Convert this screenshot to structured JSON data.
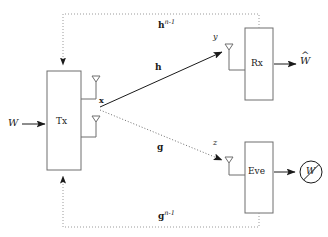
{
  "diagram": {
    "stroke_color": "#6e6e6e",
    "text_color": "#1a1a1a",
    "background": "#ffffff",
    "blocks": [
      {
        "id": "tx",
        "label": "Tx",
        "name": "transmitter-block"
      },
      {
        "id": "rx",
        "label": "Rx",
        "name": "receiver-block"
      },
      {
        "id": "eve",
        "label": "Eve",
        "name": "eavesdropper-block"
      }
    ],
    "signals": {
      "message_in": "W",
      "estimate_out": "W",
      "estimate_out_accent": "^",
      "tx_signal": "x",
      "rx_signal": "y",
      "eve_signal": "z"
    },
    "channels": [
      {
        "id": "main",
        "label": "h",
        "style": "solid",
        "name": "main-channel-arrow"
      },
      {
        "id": "wiretap",
        "label": "g",
        "style": "dotted",
        "name": "wiretap-channel-arrow"
      }
    ],
    "feedback": [
      {
        "id": "main-fb",
        "base": "h",
        "exponent": "n-1",
        "style": "dotted",
        "name": "main-channel-feedback"
      },
      {
        "id": "wiretap-fb",
        "base": "g",
        "exponent": "n-1",
        "style": "dotted",
        "name": "wiretap-channel-feedback"
      }
    ],
    "eve_output": {
      "symbol": "W",
      "crossed_out": true,
      "name": "eve-cannot-decode-symbol"
    },
    "antennas": [
      {
        "name": "tx-antenna-upper"
      },
      {
        "name": "tx-antenna-lower"
      },
      {
        "name": "rx-antenna"
      },
      {
        "name": "eve-antenna"
      }
    ]
  }
}
